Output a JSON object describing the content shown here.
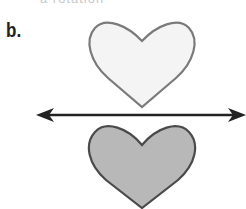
{
  "top_text": "a rotation",
  "problem_label": "b.",
  "figure": {
    "pre_image": {
      "shape": "heart",
      "fill": "#f4f4f4",
      "stroke": "#7a7a7a"
    },
    "image": {
      "shape": "heart",
      "fill": "#b8b8b8",
      "stroke": "#4a4a4a"
    },
    "line_of_reflection": {
      "type": "double-arrow line",
      "color": "#222222"
    }
  }
}
